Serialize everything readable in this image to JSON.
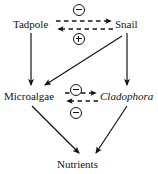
{
  "diagram": {
    "background_color": "#ffffff",
    "stroke_color": "#141414",
    "nodes": [
      {
        "id": "tadpole",
        "label": "Tadpole",
        "italic": false,
        "x": 13,
        "y": 18
      },
      {
        "id": "snail",
        "label": "Snail",
        "italic": false,
        "x": 115,
        "y": 18
      },
      {
        "id": "microalgae",
        "label": "Microalgae",
        "italic": false,
        "x": 4,
        "y": 90
      },
      {
        "id": "cladophora",
        "label": "Cladophora",
        "italic": true,
        "x": 100,
        "y": 90
      },
      {
        "id": "nutrients",
        "label": "Nutrients",
        "italic": false,
        "x": 57,
        "y": 158
      }
    ],
    "signs": [
      {
        "id": "sign-tadpole-to-snail",
        "symbol": "circled-minus",
        "value": "-",
        "x": 73,
        "y": 4,
        "between": "Tadpole and Snail (top, rightward)"
      },
      {
        "id": "sign-snail-to-tadpole",
        "symbol": "circled-plus",
        "value": "+",
        "x": 73,
        "y": 33,
        "between": "Snail and Tadpole (bottom, leftward)"
      },
      {
        "id": "sign-microalgae-to-clado",
        "symbol": "circled-minus",
        "value": "-",
        "x": 70,
        "y": 84,
        "between": "Microalgae and Cladophora (top, rightward)"
      },
      {
        "id": "sign-clado-to-microalgae",
        "symbol": "circled-minus",
        "value": "-",
        "x": 70,
        "y": 107,
        "between": "Cladophora and Microalgae (bottom, leftward)"
      }
    ],
    "dashed_arrows": [
      {
        "id": "tadpole-to-snail",
        "from": "tadpole",
        "to": "snail",
        "x1": 56,
        "y1": 21,
        "x2": 113,
        "y2": 21,
        "sign": "-"
      },
      {
        "id": "snail-to-tadpole",
        "from": "snail",
        "to": "tadpole",
        "x1": 113,
        "y1": 29,
        "x2": 56,
        "y2": 29,
        "sign": "+"
      },
      {
        "id": "microalgae-to-clado",
        "from": "microalgae",
        "to": "cladophora",
        "x1": 65,
        "y1": 93,
        "x2": 98,
        "y2": 93,
        "sign": "-"
      },
      {
        "id": "clado-to-microalgae",
        "from": "cladophora",
        "to": "microalgae",
        "x1": 98,
        "y1": 101,
        "x2": 65,
        "y2": 101,
        "sign": "-"
      }
    ],
    "solid_arrows": [
      {
        "id": "tadpole-to-microalgae",
        "from": "tadpole",
        "to": "microalgae",
        "x1": 31,
        "y1": 33,
        "x2": 31,
        "y2": 86
      },
      {
        "id": "snail-to-cladophora",
        "from": "snail",
        "to": "cladophora",
        "x1": 127,
        "y1": 33,
        "x2": 127,
        "y2": 86
      },
      {
        "id": "snail-to-microalgae",
        "from": "snail",
        "to": "microalgae",
        "x1": 122,
        "y1": 36,
        "x2": 44,
        "y2": 86
      },
      {
        "id": "microalgae-to-nutrients",
        "from": "microalgae",
        "to": "nutrients",
        "x1": 32,
        "y1": 105,
        "x2": 80,
        "y2": 154
      },
      {
        "id": "cladophora-to-nutrients",
        "from": "cladophora",
        "to": "nutrients",
        "x1": 127,
        "y1": 105,
        "x2": 95,
        "y2": 154
      }
    ]
  }
}
